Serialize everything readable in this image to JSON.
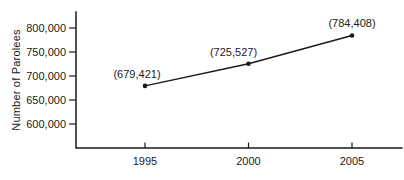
{
  "figure": {
    "background": "#ffffff",
    "ink_color": "#1a1a1a"
  },
  "chart_data": {
    "type": "line",
    "title": "",
    "xlabel": "",
    "ylabel": "Number of Parolees",
    "categories": [
      1995,
      2000,
      2005
    ],
    "x_tick_labels": [
      "1995",
      "2000",
      "2005"
    ],
    "series": [
      {
        "name": "Number of Parolees",
        "values": [
          679421,
          725527,
          784408
        ]
      }
    ],
    "point_labels": [
      "(679,421)",
      "(725,527)",
      "(784,408)"
    ],
    "y_ticks": [
      600000,
      650000,
      700000,
      750000,
      800000
    ],
    "y_tick_labels": [
      "600,000",
      "650,000",
      "700,000",
      "750,000",
      "800,000"
    ],
    "ylim": [
      550000,
      829000
    ],
    "xlim": [
      1991.7,
      2007.5
    ],
    "grid": false,
    "legend": false,
    "marker": "filled-dot",
    "line_color": "#1a1a1a",
    "background": "#ffffff"
  }
}
